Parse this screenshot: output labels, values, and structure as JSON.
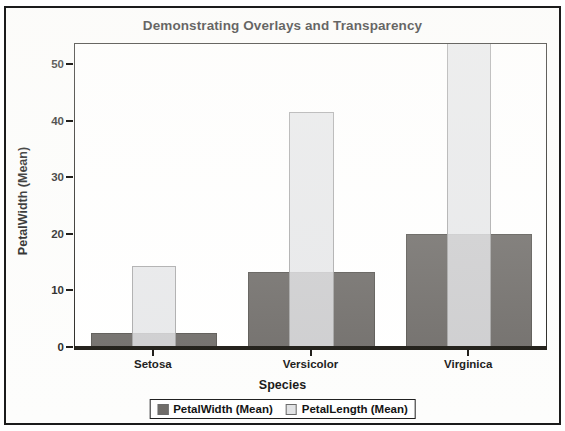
{
  "chart_data": {
    "type": "bar",
    "title": "Demonstrating Overlays and Transparency",
    "xlabel": "Species",
    "ylabel": "PetalWidth (Mean)",
    "categories": [
      "Setosa",
      "Versicolor",
      "Virginica"
    ],
    "yticks": [
      0,
      10,
      20,
      30,
      40,
      50
    ],
    "ytick_labels": [
      "0",
      "10",
      "20",
      "30",
      "40",
      "50"
    ],
    "ylim": [
      0,
      53.7
    ],
    "grid": false,
    "legend_position": "bottom",
    "overlay": true,
    "series": [
      {
        "name": "PetalWidth (Mean)",
        "color": "#6e6b68",
        "bar_width_ratio": 0.8,
        "opacity": 1,
        "values": [
          2.5,
          13.3,
          20.0
        ]
      },
      {
        "name": "PetalLength (Mean)",
        "color": "#e2e3e5",
        "bar_width_ratio": 0.28,
        "opacity": 0.82,
        "values": [
          14.3,
          41.5,
          53.7
        ]
      }
    ]
  },
  "legend": {
    "entries": [
      {
        "label": "PetalWidth (Mean)",
        "swatch": "#6e6b68"
      },
      {
        "label": "PetalLength (Mean)",
        "swatch": "#e2e3e5"
      }
    ]
  }
}
